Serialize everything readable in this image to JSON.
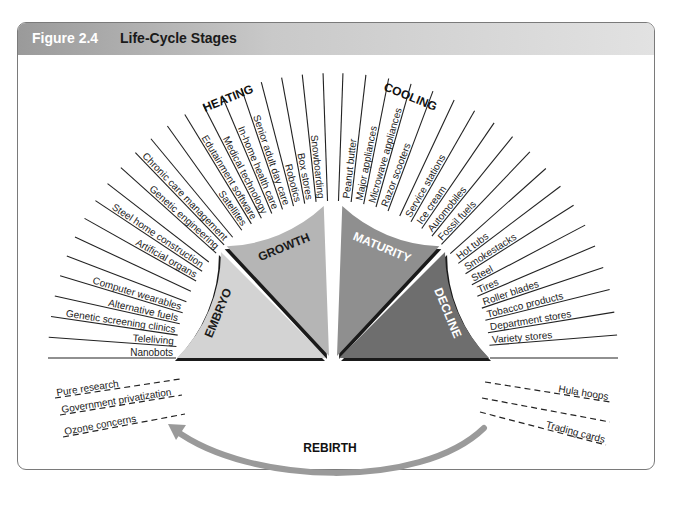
{
  "figure": {
    "number": "Figure 2.4",
    "title": "Life-Cycle Stages"
  },
  "groups": {
    "heating": "HEATING",
    "cooling": "COOLING",
    "rebirth": "REBIRTH"
  },
  "stages": [
    {
      "name": "EMBRYO",
      "color": "#d3d3d3",
      "text_color": "#1a1a1a"
    },
    {
      "name": "GROWTH",
      "color": "#b5b5b5",
      "text_color": "#1a1a1a"
    },
    {
      "name": "MATURITY",
      "color": "#8f8f8f",
      "text_color": "#ffffff"
    },
    {
      "name": "DECLINE",
      "color": "#6e6e6e",
      "text_color": "#ffffff"
    }
  ],
  "left_labels": [
    "Nanobots",
    "Teleliving",
    "Genetic screening clinics",
    "Alternative fuels",
    "Computer wearables",
    "",
    "",
    "Artificial organs",
    "Steel home construction",
    "",
    "Genetic engineering",
    "Chronic care management",
    "",
    "Satellites",
    "Edutainment software",
    "Medical technology",
    "In-home health care",
    "Senior adult day care",
    "Robotics",
    "Box stores",
    "Snowboarding",
    ""
  ],
  "right_labels": [
    "",
    "Peanut butter",
    "Major appliances",
    "Microwave appliances",
    "Razor scooters",
    "",
    "Service stations",
    "Ice cream",
    "Automobiles",
    "Fossil fuels",
    "",
    "Hot tubs",
    "Smokestacks",
    "Steel",
    "Tires",
    "Roller blades",
    "Tobacco products",
    "Department stores",
    "Variety stores",
    ""
  ],
  "rebirth_left": [
    "Pure research",
    "Government privatization",
    "Ozone concerns"
  ],
  "rebirth_right": [
    "Hula hoops",
    "",
    "Trading cards"
  ],
  "colors": {
    "line": "#222222",
    "arrow": "#9a9a9a",
    "shadow": "#1a1a1a"
  }
}
